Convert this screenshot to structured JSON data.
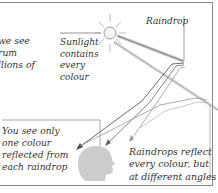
{
  "texts": {
    "left_caption": [
      "we see",
      "rum",
      "llions of"
    ],
    "sunlight_caption": [
      "Sunlight",
      "contains",
      "every",
      "colour"
    ],
    "raindrop_label": "Raindrop",
    "you_see_caption": [
      "You see only",
      "one colour",
      "reflected from",
      "each raindrop"
    ],
    "reflect_caption": [
      "Raindrops reflect",
      "every colour, but",
      "at different angles"
    ]
  },
  "icons": {
    "sun": "sun-icon",
    "head": "head-silhouette-icon"
  },
  "colors": {
    "frame": "#8a8a8a",
    "text": "#333333",
    "ray_dark": "#555555",
    "ray_light": "#bbbbbb",
    "head": "#cccccc"
  }
}
